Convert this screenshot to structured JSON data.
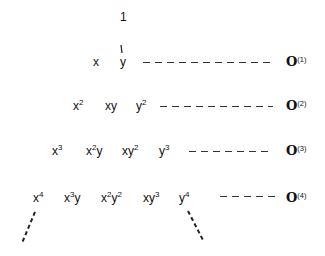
{
  "diagram": {
    "rows": [
      {
        "degree": 0,
        "terms": [
          {
            "base": "1",
            "sup": ""
          }
        ],
        "label": null
      },
      {
        "degree": 1,
        "terms": [
          {
            "base": "x",
            "sup": ""
          },
          {
            "base": "y",
            "sup": ""
          }
        ],
        "label": {
          "symbol": "𝒪",
          "index": "(1)"
        }
      },
      {
        "degree": 2,
        "terms": [
          {
            "base": "x",
            "sup": "2"
          },
          {
            "base": "xy",
            "sup": ""
          },
          {
            "base": "y",
            "sup": "2"
          }
        ],
        "label": {
          "symbol": "𝒪",
          "index": "(2)"
        }
      },
      {
        "degree": 3,
        "terms": [
          {
            "base": "x",
            "sup": "3"
          },
          {
            "base": "x",
            "sup": "2",
            "tail": "y"
          },
          {
            "base": "xy",
            "sup": "2"
          },
          {
            "base": "y",
            "sup": "3"
          }
        ],
        "label": {
          "symbol": "𝒪",
          "index": "(3)"
        }
      },
      {
        "degree": 4,
        "terms": [
          {
            "base": "x",
            "sup": "4"
          },
          {
            "base": "x",
            "sup": "3",
            "tail": "y"
          },
          {
            "base": "x",
            "sup": "2",
            "tail": "y",
            "sup2": "2"
          },
          {
            "base": "xy",
            "sup": "3"
          },
          {
            "base": "y",
            "sup": "4"
          }
        ],
        "label": {
          "symbol": "𝒪",
          "index": "(4)"
        }
      }
    ],
    "t": {
      "one": "1",
      "x": "x",
      "y": "y",
      "xy": "xy",
      "s2": "2",
      "s3": "3",
      "s4": "4"
    },
    "labels": {
      "sym": "O",
      "i1": "(1)",
      "i2": "(2)",
      "i3": "(3)",
      "i4": "(4)"
    }
  }
}
